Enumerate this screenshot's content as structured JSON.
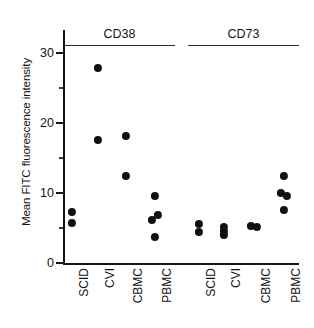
{
  "figure": {
    "ylabel": "Mean FITC fluorescence intensity"
  },
  "chart_data": {
    "type": "scatter",
    "title": "",
    "xlabel": "",
    "ylabel": "Mean FITC fluorescence intensity",
    "ylim": [
      0,
      31
    ],
    "yticks": [
      0,
      10,
      20,
      30
    ],
    "ytick_labels": [
      "0",
      "10",
      "20",
      "30"
    ],
    "yminor_ticks": [
      5,
      15,
      25
    ],
    "grid": false,
    "legend": "none",
    "group_headers": [
      "CD38",
      "CD73"
    ],
    "categories": [
      "SCID",
      "CVI",
      "CBMC",
      "PBMC",
      "SCID",
      "CVI",
      "CBMC",
      "PBMC"
    ],
    "series": [
      {
        "name": "CD38",
        "groups": [
          {
            "category": "SCID",
            "values": [
              7.3,
              5.7
            ],
            "offsets": [
              0,
              0
            ]
          },
          {
            "category": "CVI",
            "values": [
              27.9,
              17.6
            ],
            "offsets": [
              0,
              0
            ]
          },
          {
            "category": "CBMC",
            "values": [
              18.1,
              12.4
            ],
            "offsets": [
              0,
              0
            ]
          },
          {
            "category": "PBMC",
            "values": [
              9.6,
              6.9,
              6.1,
              3.7
            ],
            "offsets": [
              0,
              3,
              -3,
              0
            ]
          }
        ]
      },
      {
        "name": "CD73",
        "groups": [
          {
            "category": "SCID",
            "values": [
              5.6,
              4.4
            ],
            "offsets": [
              0,
              0
            ]
          },
          {
            "category": "CVI",
            "values": [
              5.1,
              4.6,
              4.0
            ],
            "offsets": [
              0,
              0,
              0
            ]
          },
          {
            "category": "CBMC",
            "values": [
              5.3,
              5.2
            ],
            "offsets": [
              -3,
              3
            ]
          },
          {
            "category": "PBMC",
            "values": [
              12.4,
              10.0,
              9.6,
              7.6
            ],
            "offsets": [
              0,
              -3,
              3,
              0
            ]
          }
        ]
      }
    ]
  }
}
